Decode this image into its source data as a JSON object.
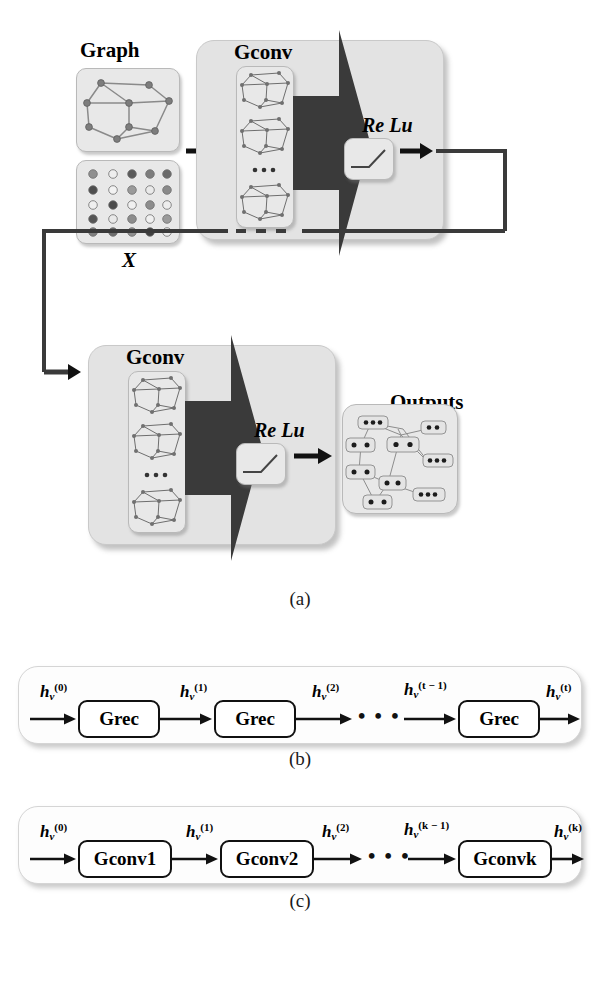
{
  "figure": {
    "panels": [
      {
        "id": "a",
        "caption": "(a)",
        "inputs": {
          "graph_label": "Graph",
          "matrix_label": "X"
        },
        "stage1": {
          "title": "Gconv",
          "activation": "Re Lu",
          "stack_ellipsis": "..."
        },
        "stage2": {
          "title": "Gconv",
          "activation": "Re Lu",
          "stack_ellipsis": "..."
        },
        "outputs": {
          "label": "Outputs"
        }
      },
      {
        "id": "b",
        "caption": "(b)",
        "blocks": [
          "Grec",
          "Grec",
          "Grec"
        ],
        "state_labels": [
          "h",
          "h",
          "h",
          "h"
        ],
        "state_sub": "v",
        "state_sup": [
          "(0)",
          "(1)",
          "(2)",
          "(t − 1)",
          "(t)"
        ],
        "ellipsis": "• • •"
      },
      {
        "id": "c",
        "caption": "(c)",
        "blocks": [
          "Gconv1",
          "Gconv2",
          "Gconvk"
        ],
        "state_sub": "v",
        "state_sup": [
          "(0)",
          "(1)",
          "(2)",
          "(k − 1)",
          "(k)"
        ],
        "ellipsis": "• • •"
      }
    ]
  },
  "labels": {
    "graph": "Graph",
    "x": "X",
    "gconv": "Gconv",
    "relu": "Re Lu",
    "outputs": "Outputs",
    "dots": "• • •",
    "h": "h",
    "v": "v",
    "sup0": "(0)",
    "sup1": "(1)",
    "sup2": "(2)",
    "supTm1": "(t − 1)",
    "supT": "(t)",
    "supKm1": "(k − 1)",
    "supK": "(k)",
    "grec": "Grec",
    "gconv1": "Gconv1",
    "gconv2": "Gconv2",
    "gconvk": "Gconvk",
    "cap_a": "(a)",
    "cap_b": "(b)",
    "cap_c": "(c)"
  },
  "colors": {
    "panel_fill": "#e3e3e3",
    "card_fill": "#e8e8e8",
    "dark_arrow": "#3a3a3a",
    "line": "#333333",
    "node": "#777777",
    "background": "#ffffff"
  }
}
